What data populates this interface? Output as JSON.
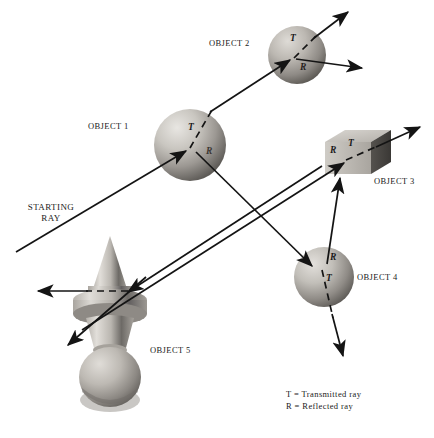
{
  "diagram": {
    "background": "#ffffff",
    "ink": "#1a1a1a",
    "labels": {
      "starting_ray_line1": "STARTING",
      "starting_ray_line2": "RAY",
      "object1": "OBJECT 1",
      "object2": "OBJECT 2",
      "object3": "OBJECT 3",
      "object4": "OBJECT 4",
      "object5": "OBJECT 5"
    },
    "ray_marks": {
      "obj1_t": "T",
      "obj1_r": "R",
      "obj2_t": "T",
      "obj2_r": "R",
      "obj3_t": "T",
      "obj3_r": "R",
      "obj4_t": "T",
      "obj4_r": "R"
    },
    "legend": {
      "line1": "T = Transmitted ray",
      "line2": "R = Reflected ray"
    },
    "objects": [
      {
        "name": "OBJECT 1",
        "shape": "sphere",
        "cx": 190,
        "cy": 145,
        "r": 36
      },
      {
        "name": "OBJECT 2",
        "shape": "sphere",
        "cx": 297,
        "cy": 55,
        "r": 29
      },
      {
        "name": "OBJECT 3",
        "shape": "cube",
        "x": 325,
        "y": 132,
        "w": 56,
        "h": 42
      },
      {
        "name": "OBJECT 4",
        "shape": "sphere",
        "cx": 324,
        "cy": 277,
        "r": 30
      },
      {
        "name": "OBJECT 5",
        "shape": "finial",
        "cx": 110,
        "cy": 315
      }
    ]
  }
}
